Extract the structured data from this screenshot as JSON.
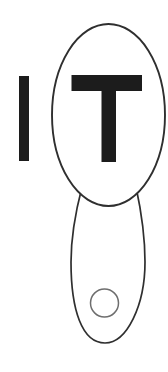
{
  "canvas": {
    "width": 168,
    "height": 372,
    "background": "#ffffff"
  },
  "figure": {
    "word": "IT",
    "letters": [
      {
        "char": "I"
      },
      {
        "char": "T"
      }
    ],
    "colors": {
      "letter": "#1c1c1c",
      "outline": "#2f2f2f",
      "inner_circle_outline": "#6e6e6e",
      "shape_fill": "#ffffff"
    }
  }
}
